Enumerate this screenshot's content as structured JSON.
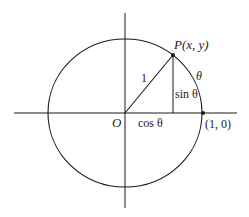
{
  "diagram": {
    "colors": {
      "stroke": "#1a1a1a",
      "background": "#ffffff"
    },
    "labels": {
      "point_p": "P(x, y)",
      "origin": "O",
      "radius": "1",
      "arc_angle": "θ",
      "sin": "sin θ",
      "cos": "cos θ",
      "unit_point": "(1, 0)"
    },
    "geometry": {
      "center": [
        125,
        113
      ],
      "radius_x": 77,
      "radius_y": 74,
      "point_p": [
        173,
        55
      ],
      "unit_point": [
        203,
        113
      ]
    }
  }
}
